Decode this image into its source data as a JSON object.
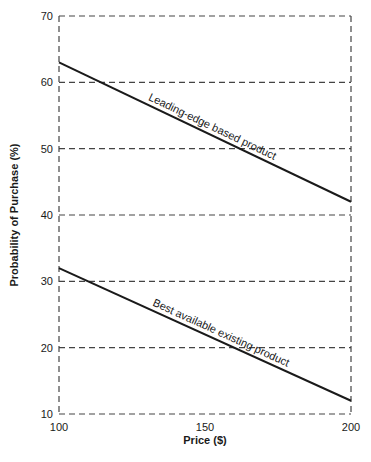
{
  "chart_data": {
    "type": "line",
    "title": "",
    "xlabel": "Price ($)",
    "ylabel": "Probability of Purchase (%)",
    "xlim": [
      100,
      200
    ],
    "ylim": [
      10,
      70
    ],
    "x_ticks": [
      100,
      150,
      200
    ],
    "y_ticks": [
      10,
      20,
      30,
      40,
      50,
      60,
      70
    ],
    "grid": "dashed horizontal lines at each y tick; dashed frame",
    "legend": "none (inline line labels)",
    "x": [
      100,
      200
    ],
    "series": [
      {
        "name": "Leading-edge based product",
        "values": [
          63,
          42
        ]
      },
      {
        "name": "Best available existing product",
        "values": [
          32,
          12
        ]
      }
    ],
    "annotations": [
      {
        "text": "Leading-edge based product",
        "along_series": 0
      },
      {
        "text": "Best available existing product",
        "along_series": 1
      }
    ]
  },
  "colors": {
    "line": "#1a1a1a",
    "grid": "#444444",
    "background": "#ffffff"
  }
}
